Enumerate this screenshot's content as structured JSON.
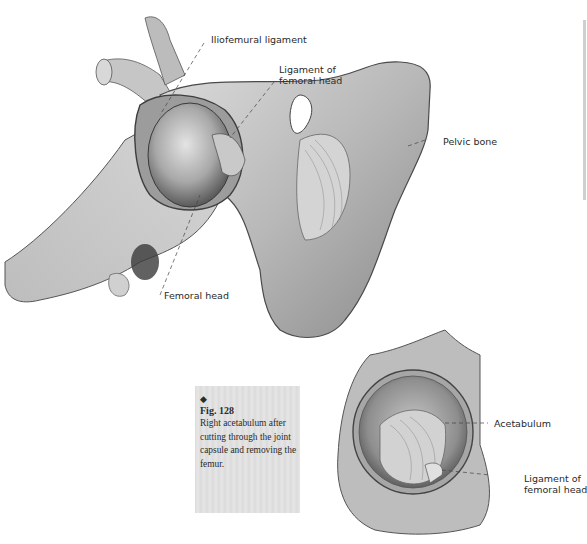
{
  "figure": {
    "number_label": "Fig. 128",
    "marker": "◆",
    "caption_lines": [
      "Right acetabulum after",
      "cutting through the joint",
      "capsule and removing the",
      "femur."
    ]
  },
  "main_illustration": {
    "description": "Hip joint with opened capsule showing femoral head",
    "labels": {
      "iliofemoral": "Iliofemural ligament",
      "lig_femoral_head_1": "Ligament of",
      "lig_femoral_head_2": "femoral head",
      "pelvic_bone": "Pelvic bone",
      "femoral_head": "Femoral head"
    }
  },
  "inset_illustration": {
    "description": "Right acetabulum",
    "labels": {
      "acetabulum": "Acetabulum",
      "lig_femoral_head_1": "Ligament of",
      "lig_femoral_head_2": "femoral head"
    }
  },
  "colors": {
    "bone_light": "#cfcfcf",
    "bone_mid": "#a9a9a9",
    "bone_dark": "#6e6e6e",
    "caption_bg": "#dedede",
    "text": "#2a2a2a"
  }
}
